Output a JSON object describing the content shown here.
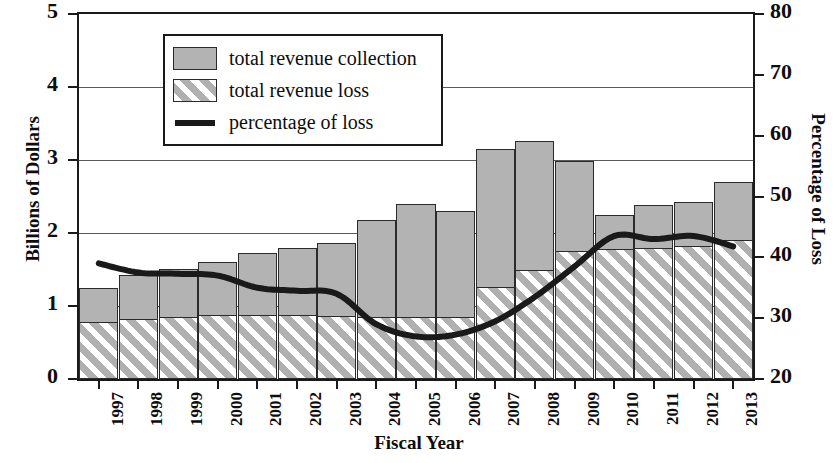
{
  "chart_data": {
    "type": "bar",
    "title": "",
    "xlabel": "Fiscal Year",
    "ylabel": "Billions of Dollars",
    "y2label": "Percentage of Loss",
    "ylim": [
      0,
      5
    ],
    "y2lim": [
      20,
      80
    ],
    "yticks": [
      "0",
      "1",
      "2",
      "3",
      "4",
      "5"
    ],
    "y2ticks": [
      "20",
      "30",
      "40",
      "50",
      "60",
      "70",
      "80"
    ],
    "grid": true,
    "legend_position": "top-left",
    "categories": [
      "1997",
      "1998",
      "1999",
      "2000",
      "2001",
      "2002",
      "2003",
      "2004",
      "2005",
      "2006",
      "2007",
      "2008",
      "2009",
      "2010",
      "2011",
      "2012",
      "2013"
    ],
    "series": [
      {
        "name": "total revenue collection",
        "type": "bar",
        "axis": "left",
        "units": "Billions of Dollars",
        "values": [
          1.24,
          1.43,
          1.51,
          1.6,
          1.72,
          1.79,
          1.86,
          2.18,
          2.4,
          2.3,
          3.15,
          3.26,
          2.98,
          2.25,
          2.38,
          2.42,
          2.7
        ]
      },
      {
        "name": "total revenue loss",
        "type": "bar",
        "axis": "left",
        "units": "Billions of Dollars",
        "values": [
          0.78,
          0.82,
          0.85,
          0.87,
          0.87,
          0.87,
          0.86,
          0.85,
          0.85,
          0.85,
          1.26,
          1.5,
          1.75,
          1.78,
          1.8,
          1.82,
          1.9
        ]
      },
      {
        "name": "percentage of loss",
        "type": "line",
        "axis": "right",
        "units": "Percentage of Loss",
        "values": [
          39.0,
          37.5,
          37.3,
          37.0,
          35.0,
          34.5,
          34.0,
          29.0,
          27.0,
          27.3,
          29.5,
          33.5,
          38.5,
          43.5,
          43.0,
          43.5,
          41.8
        ]
      }
    ]
  },
  "legend": {
    "items": [
      {
        "label": "total revenue collection",
        "key": "solid-swatch"
      },
      {
        "label": "total revenue loss",
        "key": "hatched-swatch"
      },
      {
        "label": "percentage of loss",
        "key": "line-swatch"
      }
    ]
  }
}
